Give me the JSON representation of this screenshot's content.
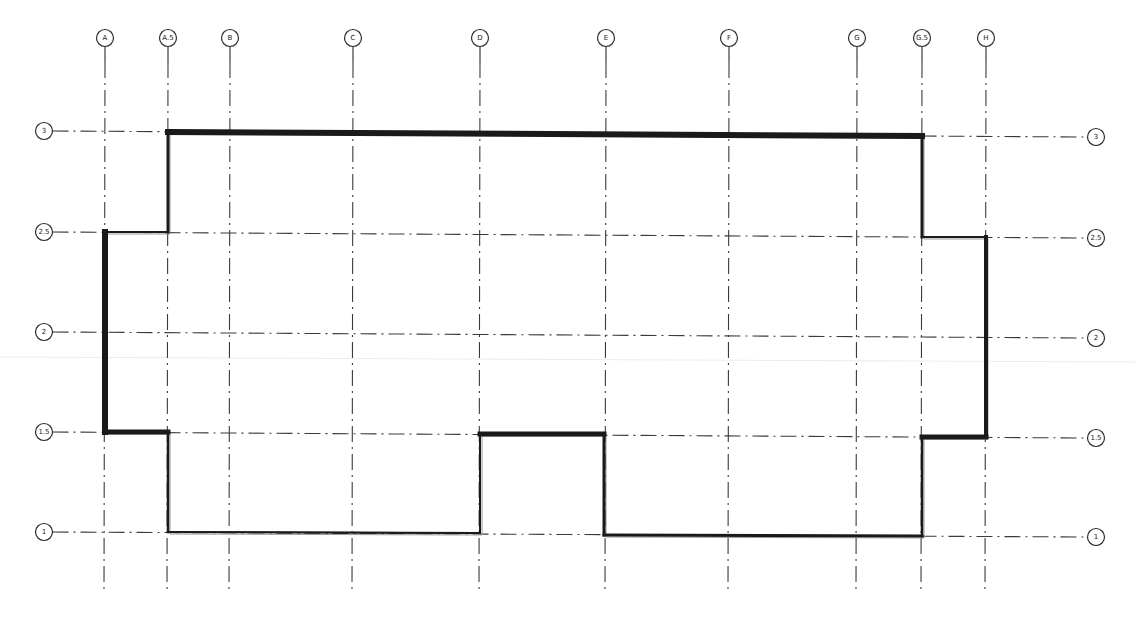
{
  "drawing": {
    "type": "floor-plan-grid",
    "colors": {
      "background": "#ffffff",
      "grid_line": "#3a3a3a",
      "wall": "#1a1a1a",
      "wall_inner": "#9a9a9a"
    },
    "columns": [
      {
        "label": "A",
        "x": 105,
        "bubble_y": 38
      },
      {
        "label": "A.5",
        "x": 168,
        "bubble_y": 38
      },
      {
        "label": "B",
        "x": 230,
        "bubble_y": 38
      },
      {
        "label": "C",
        "x": 353,
        "bubble_y": 38
      },
      {
        "label": "D",
        "x": 480,
        "bubble_y": 38
      },
      {
        "label": "E",
        "x": 606,
        "bubble_y": 38
      },
      {
        "label": "F",
        "x": 729,
        "bubble_y": 38
      },
      {
        "label": "G",
        "x": 857,
        "bubble_y": 38
      },
      {
        "label": "G.5",
        "x": 922,
        "bubble_y": 38
      },
      {
        "label": "H",
        "x": 986,
        "bubble_y": 38
      }
    ],
    "rows": [
      {
        "label": "3",
        "y_left": 131,
        "y_right": 137
      },
      {
        "label": "2.5",
        "y_left": 232,
        "y_right": 238
      },
      {
        "label": "2",
        "y_left": 332,
        "y_right": 338
      },
      {
        "label": "1.5",
        "y_left": 432,
        "y_right": 438
      },
      {
        "label": "1",
        "y_left": 532,
        "y_right": 537
      }
    ],
    "bubble_left_x": 44,
    "bubble_right_x": 1096,
    "grid_bottom_y": 590,
    "grid_top_y": 52,
    "outline": {
      "points": [
        [
          168,
          132
        ],
        [
          922,
          136
        ],
        [
          922,
          237
        ],
        [
          986,
          237
        ],
        [
          986,
          437
        ],
        [
          922,
          437
        ],
        [
          922,
          536
        ],
        [
          604,
          535
        ],
        [
          604,
          434
        ],
        [
          480,
          434
        ],
        [
          480,
          533
        ],
        [
          168,
          532
        ],
        [
          168,
          432
        ],
        [
          105,
          432
        ],
        [
          105,
          232
        ],
        [
          168,
          232
        ]
      ],
      "thick_segments": [
        [
          [
            168,
            132
          ],
          [
            922,
            136
          ],
          6
        ],
        [
          [
            105,
            232
          ],
          [
            105,
            432
          ],
          6
        ],
        [
          [
            105,
            432
          ],
          [
            168,
            432
          ],
          5
        ],
        [
          [
            480,
            434
          ],
          [
            604,
            434
          ],
          5
        ],
        [
          [
            922,
            437
          ],
          [
            986,
            437
          ],
          5
        ],
        [
          [
            986,
            237
          ],
          [
            986,
            437
          ],
          4
        ],
        [
          [
            604,
            434
          ],
          [
            604,
            535
          ],
          3
        ],
        [
          [
            922,
            136
          ],
          [
            922,
            237
          ],
          3
        ],
        [
          [
            168,
            132
          ],
          [
            168,
            232
          ],
          3
        ],
        [
          [
            168,
            432
          ],
          [
            168,
            532
          ],
          2.5
        ],
        [
          [
            604,
            535
          ],
          [
            922,
            536
          ],
          3
        ],
        [
          [
            922,
            437
          ],
          [
            922,
            536
          ],
          2.5
        ]
      ],
      "thin_segments": [
        [
          [
            105,
            232
          ],
          [
            168,
            232
          ],
          2
        ],
        [
          [
            922,
            237
          ],
          [
            986,
            237
          ],
          2
        ],
        [
          [
            168,
            532
          ],
          [
            480,
            533
          ],
          2
        ],
        [
          [
            480,
            434
          ],
          [
            480,
            533
          ],
          2
        ]
      ]
    }
  }
}
